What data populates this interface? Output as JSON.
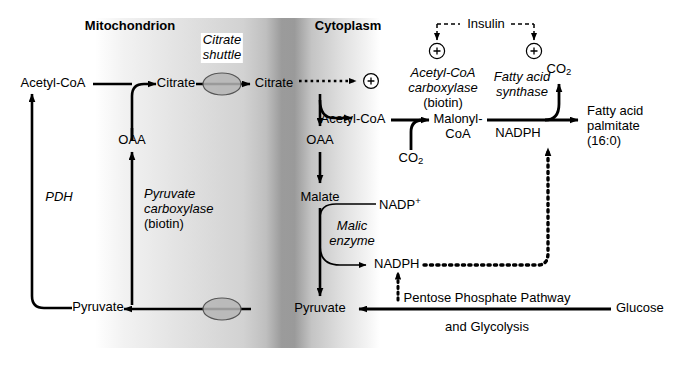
{
  "figure": {
    "compartments": {
      "left_label": "Mitochondrion",
      "right_label": "Cytoplasm"
    },
    "membrane": {
      "shuttle_label_line1": "Citrate",
      "shuttle_label_line2": "shuttle",
      "transporter_icon": "membrane-transporter-oval",
      "transporter_count": 2
    },
    "metabolites": {
      "mito_acetyl_coa": "Acetyl-CoA",
      "mito_citrate": "Citrate",
      "mito_oaa": "OAA",
      "mito_pyruvate": "Pyruvate",
      "cyto_citrate": "Citrate",
      "cyto_oaa": "OAA",
      "cyto_malate": "Malate",
      "cyto_pyruvate": "Pyruvate",
      "cyto_acetyl_coa": "Acetyl-CoA",
      "malonyl_coa_line1": "Malonyl-",
      "malonyl_coa_line2": "CoA",
      "co2_carboxylase": "CO2",
      "co2_synthase": "CO2",
      "nadph_synthase": "NADPH",
      "nadp_plus": "NADP+",
      "nadph_malic": "NADPH",
      "glucose": "Glucose",
      "product_line1": "Fatty acid",
      "product_line2": "palmitate",
      "product_line3": "(16:0)"
    },
    "enzymes": {
      "pdh": "PDH",
      "pyruvate_carboxylase_line1": "Pyruvate",
      "pyruvate_carboxylase_line2": "carboxylase",
      "pyruvate_carboxylase_line3": "(biotin)",
      "acetyl_coa_carboxylase_line1": "Acetyl-CoA",
      "acetyl_coa_carboxylase_line2": "carboxylase",
      "acetyl_coa_carboxylase_line3": "(biotin)",
      "fatty_acid_synthase_line1": "Fatty acid",
      "fatty_acid_synthase_line2": "synthase",
      "malic_enzyme_line1": "Malic",
      "malic_enzyme_line2": "enzyme"
    },
    "pathways": {
      "ppp_line1": "Pentose Phosphate Pathway",
      "ppp_line2": "and Glycolysis"
    },
    "regulation": {
      "hormone": "Insulin",
      "activation_symbol": "+",
      "activation_targets": [
        "acetyl-coa-carboxylase",
        "fatty-acid-synthase"
      ],
      "allosteric_activator_symbol": "+",
      "allosteric_activator_source": "Citrate"
    },
    "colors": {
      "ink": "#000000",
      "background": "#ffffff",
      "membrane_light": "#e9e9e9",
      "membrane_dark": "#9a9a9a",
      "transporter_fill": "#b5b5b5"
    }
  }
}
